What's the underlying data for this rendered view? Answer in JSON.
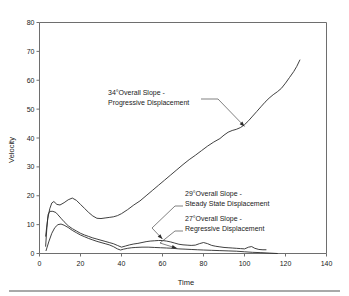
{
  "chart_data": {
    "type": "line",
    "title": "",
    "xlabel": "Time",
    "ylabel": "Velocity",
    "xlim": [
      0,
      140
    ],
    "ylim": [
      0,
      80
    ],
    "xticks": [
      0,
      20,
      40,
      60,
      80,
      100,
      120,
      140
    ],
    "yticks": [
      0,
      10,
      20,
      30,
      40,
      50,
      60,
      70,
      80
    ],
    "grid": false,
    "legend": "none",
    "series": [
      {
        "name": "34 deg Overall Slope - Progressive Displacement",
        "points": [
          [
            3.0,
            6.0
          ],
          [
            4.0,
            12.0
          ],
          [
            5.0,
            15.5
          ],
          [
            6.0,
            17.5
          ],
          [
            7.0,
            18.0
          ],
          [
            8.5,
            17.0
          ],
          [
            10.0,
            16.8
          ],
          [
            12.0,
            17.6
          ],
          [
            14.0,
            18.6
          ],
          [
            16.0,
            19.2
          ],
          [
            18.0,
            18.4
          ],
          [
            20.0,
            17.0
          ],
          [
            22.0,
            15.6
          ],
          [
            24.0,
            14.2
          ],
          [
            26.0,
            13.0
          ],
          [
            28.0,
            12.2
          ],
          [
            30.0,
            12.1
          ],
          [
            32.0,
            12.3
          ],
          [
            34.0,
            12.5
          ],
          [
            36.0,
            12.7
          ],
          [
            38.0,
            13.1
          ],
          [
            40.0,
            13.8
          ],
          [
            43.0,
            15.2
          ],
          [
            46.0,
            16.8
          ],
          [
            49.0,
            18.2
          ],
          [
            52.0,
            20.0
          ],
          [
            55.0,
            21.8
          ],
          [
            58.0,
            23.6
          ],
          [
            61.0,
            25.4
          ],
          [
            64.0,
            27.2
          ],
          [
            67.0,
            29.0
          ],
          [
            70.0,
            30.8
          ],
          [
            73.0,
            32.5
          ],
          [
            76.0,
            34.0
          ],
          [
            79.0,
            35.6
          ],
          [
            82.0,
            37.2
          ],
          [
            85.0,
            38.6
          ],
          [
            88.0,
            39.8
          ],
          [
            90.0,
            41.0
          ],
          [
            92.0,
            42.0
          ],
          [
            94.0,
            42.6
          ],
          [
            96.0,
            43.0
          ],
          [
            98.0,
            43.6
          ],
          [
            100.0,
            44.6
          ],
          [
            102.0,
            46.0
          ],
          [
            104.0,
            47.6
          ],
          [
            106.0,
            49.2
          ],
          [
            108.0,
            50.8
          ],
          [
            110.0,
            52.4
          ],
          [
            112.0,
            53.8
          ],
          [
            114.0,
            55.0
          ],
          [
            116.0,
            56.0
          ],
          [
            118.0,
            57.2
          ],
          [
            120.0,
            59.0
          ],
          [
            122.0,
            61.0
          ],
          [
            124.0,
            63.0
          ],
          [
            125.5,
            64.8
          ],
          [
            127.0,
            67.0
          ]
        ]
      },
      {
        "name": "29 deg Overall Slope - Steady State Displacement",
        "points": [
          [
            3.0,
            2.5
          ],
          [
            3.6,
            9.0
          ],
          [
            4.2,
            13.5
          ],
          [
            5.0,
            14.6
          ],
          [
            6.5,
            14.6
          ],
          [
            8.0,
            14.2
          ],
          [
            9.0,
            13.4
          ],
          [
            10.5,
            12.2
          ],
          [
            12.0,
            11.0
          ],
          [
            14.0,
            9.6
          ],
          [
            16.0,
            8.6
          ],
          [
            18.0,
            7.8
          ],
          [
            20.0,
            7.0
          ],
          [
            22.0,
            6.4
          ],
          [
            24.0,
            5.9
          ],
          [
            26.0,
            5.4
          ],
          [
            28.0,
            5.0
          ],
          [
            30.0,
            4.6
          ],
          [
            32.0,
            4.2
          ],
          [
            34.0,
            3.8
          ],
          [
            36.0,
            3.4
          ],
          [
            38.0,
            2.8
          ],
          [
            40.0,
            2.2
          ],
          [
            42.0,
            2.6
          ],
          [
            44.0,
            3.0
          ],
          [
            46.0,
            3.3
          ],
          [
            48.0,
            3.5
          ],
          [
            50.0,
            3.8
          ],
          [
            52.0,
            4.1
          ],
          [
            54.0,
            4.3
          ],
          [
            56.0,
            4.4
          ],
          [
            58.0,
            4.5
          ],
          [
            60.0,
            4.5
          ],
          [
            62.0,
            4.3
          ],
          [
            64.0,
            4.0
          ],
          [
            66.0,
            3.6
          ],
          [
            68.0,
            3.2
          ],
          [
            70.0,
            3.0
          ],
          [
            72.0,
            2.9
          ],
          [
            74.0,
            2.8
          ],
          [
            76.0,
            2.9
          ],
          [
            78.0,
            3.4
          ],
          [
            80.0,
            3.8
          ],
          [
            82.0,
            3.4
          ],
          [
            84.0,
            2.8
          ],
          [
            86.0,
            2.5
          ],
          [
            88.0,
            2.3
          ],
          [
            90.0,
            2.1
          ],
          [
            92.0,
            2.0
          ],
          [
            94.0,
            1.9
          ],
          [
            96.0,
            1.8
          ],
          [
            98.0,
            1.7
          ],
          [
            100.0,
            1.6
          ],
          [
            102.0,
            2.2
          ],
          [
            103.5,
            2.4
          ],
          [
            105.0,
            1.8
          ],
          [
            107.0,
            1.4
          ],
          [
            109.0,
            1.3
          ],
          [
            110.5,
            1.3
          ]
        ]
      },
      {
        "name": "27 deg Overall Slope - Regressive Displacement",
        "points": [
          [
            3.2,
            1.0
          ],
          [
            4.5,
            4.0
          ],
          [
            6.0,
            7.0
          ],
          [
            7.5,
            9.0
          ],
          [
            9.0,
            10.0
          ],
          [
            10.5,
            10.2
          ],
          [
            12.0,
            9.8
          ],
          [
            14.0,
            9.0
          ],
          [
            16.0,
            8.0
          ],
          [
            18.0,
            7.2
          ],
          [
            20.0,
            6.4
          ],
          [
            22.0,
            5.8
          ],
          [
            24.0,
            5.2
          ],
          [
            26.0,
            4.7
          ],
          [
            28.0,
            4.2
          ],
          [
            30.0,
            3.8
          ],
          [
            32.0,
            3.4
          ],
          [
            34.0,
            3.0
          ],
          [
            36.0,
            2.4
          ],
          [
            38.0,
            1.6
          ],
          [
            39.5,
            1.2
          ],
          [
            41.0,
            1.5
          ],
          [
            43.0,
            1.8
          ],
          [
            45.0,
            2.0
          ],
          [
            47.0,
            2.1
          ],
          [
            50.0,
            2.2
          ],
          [
            53.0,
            2.2
          ],
          [
            56.0,
            2.1
          ],
          [
            59.0,
            2.0
          ],
          [
            62.0,
            1.9
          ],
          [
            65.0,
            1.8
          ],
          [
            68.0,
            1.6
          ],
          [
            71.0,
            1.5
          ],
          [
            74.0,
            1.4
          ],
          [
            77.0,
            1.3
          ],
          [
            80.0,
            1.2
          ],
          [
            84.0,
            1.1
          ],
          [
            88.0,
            1.0
          ],
          [
            92.0,
            0.9
          ],
          [
            96.0,
            0.8
          ],
          [
            100.0,
            0.6
          ],
          [
            104.0,
            0.4
          ],
          [
            108.0,
            0.3
          ],
          [
            112.0,
            0.15
          ],
          [
            116.0,
            0.0
          ]
        ]
      }
    ],
    "annotations": [
      {
        "id": "progressive",
        "line1": "34°Overall Slope -",
        "line2": "Progressive Displacement",
        "target_x": 100,
        "target_y": 44
      },
      {
        "id": "steady-state",
        "line1": "29°Overall Slope -",
        "line2": "Steady State Displacement",
        "target_x": 60,
        "target_y": 5
      },
      {
        "id": "regressive",
        "line1": "27°Overall Slope -",
        "line2": "Regressive Displacement",
        "target_x": 67,
        "target_y": 1.8
      }
    ]
  }
}
